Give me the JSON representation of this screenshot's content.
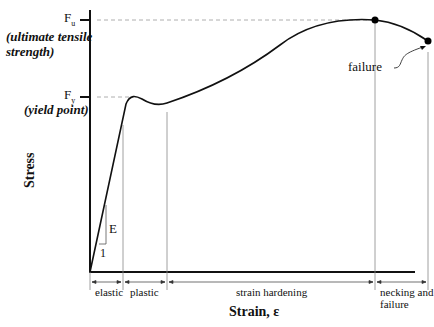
{
  "diagram": {
    "y_axis_label": "Stress",
    "x_axis_label": "Strain, ε",
    "levels": [
      {
        "symbol": "F",
        "sub": "u",
        "description_line1": "(ultimate tensile",
        "description_line2": "strength)"
      },
      {
        "symbol": "F",
        "sub": "y",
        "description_line1": "(yield point)"
      }
    ],
    "slope_label": "E",
    "slope_run_label": "1",
    "failure_label": "failure",
    "regions": [
      {
        "label": "elastic"
      },
      {
        "label": "plastic"
      },
      {
        "label": "strain hardening"
      },
      {
        "label": "necking and",
        "label2": "failure"
      }
    ]
  }
}
